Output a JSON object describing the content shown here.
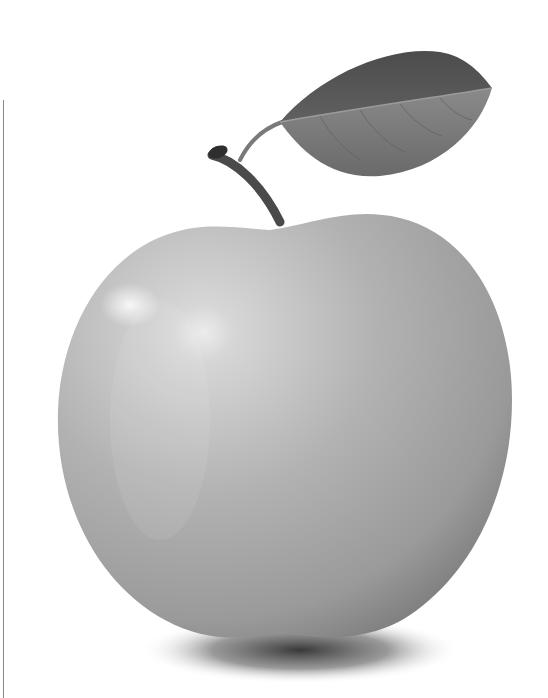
{
  "image": {
    "subject": "apple with leaf",
    "style": "grayscale photograph",
    "width": 548,
    "height": 698,
    "colors": {
      "background": "#ffffff",
      "apple_light": "#d9d9d9",
      "apple_mid": "#a8a8a8",
      "apple_dark": "#6e6e6e",
      "leaf_dark": "#555555",
      "leaf_light": "#7c7c7c",
      "stem": "#4a4a4a",
      "shadow": "#3a3a3a",
      "rule": "#8a8a8a"
    }
  }
}
